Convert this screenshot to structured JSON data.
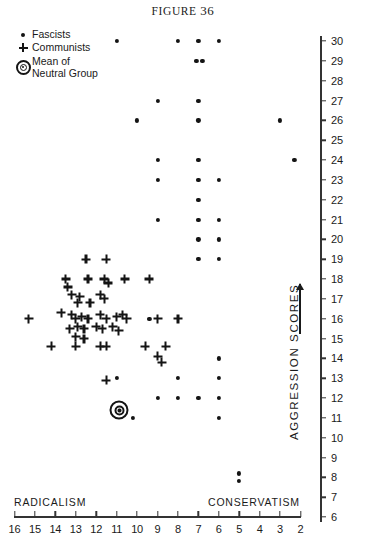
{
  "figure": {
    "title_prefix": "FIGURE",
    "title_number": "36"
  },
  "legend": {
    "items": [
      {
        "marker": "dot-marker",
        "label": "Fascists"
      },
      {
        "marker": "plus-marker",
        "label": "Communists"
      },
      {
        "marker": "bullseye-marker",
        "label_line1": "Mean of",
        "label_line2": "Neutral Group"
      }
    ]
  },
  "axes": {
    "y_title": "AGGRESSION SCORES",
    "y_ticks": [
      30,
      29,
      28,
      27,
      26,
      25,
      24,
      23,
      22,
      21,
      20,
      19,
      18,
      17,
      16,
      15,
      14,
      13,
      12,
      11,
      10,
      9,
      8,
      7,
      6
    ],
    "x_ticks": [
      16,
      15,
      14,
      13,
      12,
      11,
      10,
      9,
      8,
      7,
      6,
      5,
      4,
      3,
      2
    ],
    "x_left_label": "RADICALISM",
    "x_right_label": "CONSERVATISM"
  },
  "chart_data": {
    "type": "scatter",
    "title": "FIGURE 36",
    "xlabel": "RADICALISM  —  CONSERVATISM",
    "ylabel": "AGGRESSION SCORES",
    "xlim": [
      16,
      2
    ],
    "ylim": [
      6,
      30
    ],
    "x_axis_inverted": true,
    "grid": false,
    "legend_position": "top-left",
    "series": [
      {
        "name": "Fascists",
        "marker": "dot",
        "points": [
          [
            11.0,
            30.0
          ],
          [
            8.0,
            30.0
          ],
          [
            7.0,
            30.0
          ],
          [
            6.0,
            30.0
          ],
          [
            7.1,
            29.0
          ],
          [
            6.8,
            29.0
          ],
          [
            9.0,
            27.0
          ],
          [
            7.0,
            27.0
          ],
          [
            10.0,
            26.0
          ],
          [
            7.0,
            26.0
          ],
          [
            3.0,
            26.0
          ],
          [
            9.0,
            24.0
          ],
          [
            7.0,
            24.0
          ],
          [
            2.3,
            24.0
          ],
          [
            9.0,
            23.0
          ],
          [
            7.0,
            23.0
          ],
          [
            6.0,
            23.0
          ],
          [
            7.0,
            22.0
          ],
          [
            9.0,
            21.0
          ],
          [
            7.0,
            21.0
          ],
          [
            6.0,
            21.0
          ],
          [
            7.0,
            20.0
          ],
          [
            6.0,
            20.0
          ],
          [
            7.0,
            19.0
          ],
          [
            6.0,
            19.0
          ],
          [
            9.4,
            16.0
          ],
          [
            6.0,
            14.0
          ],
          [
            11.0,
            13.0
          ],
          [
            8.0,
            13.0
          ],
          [
            6.0,
            13.0
          ],
          [
            9.0,
            12.0
          ],
          [
            8.0,
            12.0
          ],
          [
            7.0,
            12.0
          ],
          [
            6.0,
            12.0
          ],
          [
            10.2,
            11.0
          ],
          [
            6.0,
            11.0
          ],
          [
            5.0,
            8.2
          ],
          [
            5.0,
            7.8
          ]
        ]
      },
      {
        "name": "Communists",
        "marker": "plus",
        "points": [
          [
            12.5,
            19.0
          ],
          [
            11.5,
            19.0
          ],
          [
            13.5,
            18.0
          ],
          [
            13.4,
            17.6
          ],
          [
            12.4,
            18.0
          ],
          [
            11.6,
            18.0
          ],
          [
            11.4,
            17.8
          ],
          [
            10.6,
            18.0
          ],
          [
            9.4,
            18.0
          ],
          [
            13.2,
            17.2
          ],
          [
            12.8,
            17.1
          ],
          [
            11.8,
            17.2
          ],
          [
            11.6,
            17.0
          ],
          [
            12.9,
            16.8
          ],
          [
            12.3,
            16.8
          ],
          [
            15.3,
            16.0
          ],
          [
            13.7,
            16.3
          ],
          [
            13.2,
            16.2
          ],
          [
            13.0,
            16.0
          ],
          [
            12.7,
            16.1
          ],
          [
            12.4,
            16.0
          ],
          [
            11.8,
            16.2
          ],
          [
            11.5,
            16.0
          ],
          [
            11.0,
            16.1
          ],
          [
            10.7,
            16.2
          ],
          [
            10.5,
            16.0
          ],
          [
            9.0,
            16.0
          ],
          [
            8.0,
            16.0
          ],
          [
            13.3,
            15.5
          ],
          [
            12.9,
            15.6
          ],
          [
            12.6,
            15.5
          ],
          [
            12.0,
            15.6
          ],
          [
            11.7,
            15.5
          ],
          [
            11.2,
            15.6
          ],
          [
            10.9,
            15.4
          ],
          [
            13.0,
            15.1
          ],
          [
            12.6,
            15.0
          ],
          [
            14.2,
            14.6
          ],
          [
            13.0,
            14.6
          ],
          [
            11.8,
            14.6
          ],
          [
            11.5,
            14.6
          ],
          [
            9.6,
            14.6
          ],
          [
            8.6,
            14.6
          ],
          [
            9.0,
            14.1
          ],
          [
            8.8,
            13.8
          ],
          [
            11.5,
            12.9
          ]
        ]
      },
      {
        "name": "Mean of Neutral Group",
        "marker": "bullseye",
        "points": [
          [
            10.9,
            11.4
          ]
        ]
      }
    ]
  }
}
